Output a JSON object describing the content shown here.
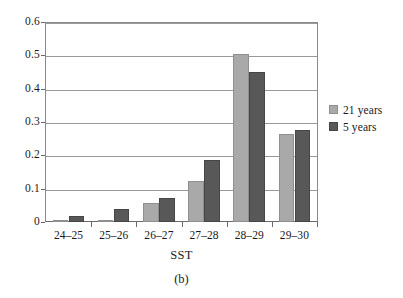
{
  "chart_data": {
    "type": "bar",
    "title": "",
    "subtitle": "",
    "caption": "(b)",
    "xlabel": "SST",
    "ylabel": "",
    "categories": [
      "24–25",
      "25–26",
      "26–27",
      "27–28",
      "28–29",
      "29–30"
    ],
    "series": [
      {
        "name": "21 years",
        "color": "#a9a9a9",
        "values": [
          0.007,
          0.006,
          0.058,
          0.123,
          0.507,
          0.266
        ]
      },
      {
        "name": "5 years",
        "color": "#585858",
        "values": [
          0.018,
          0.038,
          0.073,
          0.187,
          0.452,
          0.277
        ]
      }
    ],
    "ylim": [
      0,
      0.6
    ],
    "yticks": [
      0,
      0.1,
      0.2,
      0.3,
      0.4,
      0.5,
      0.6
    ],
    "ytick_labels": [
      "0",
      "0.1",
      "0.2",
      "0.3",
      "0.4",
      "0.5",
      "0.6"
    ],
    "grid": "horizontal",
    "legend_position": "right",
    "legend_entries": [
      "21 years",
      "5 years"
    ]
  }
}
